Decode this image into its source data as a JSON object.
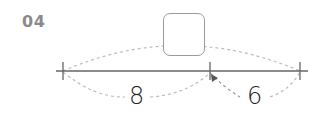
{
  "problem": {
    "number": "04"
  },
  "diagram": {
    "type": "number-line",
    "answer_box": "",
    "segments": [
      {
        "label": "8"
      },
      {
        "label": "6"
      }
    ],
    "colors": {
      "line": "#555555",
      "arc": "#b5b5b5",
      "box_border": "#9a9a9a",
      "number": "#8a8a8a"
    }
  }
}
